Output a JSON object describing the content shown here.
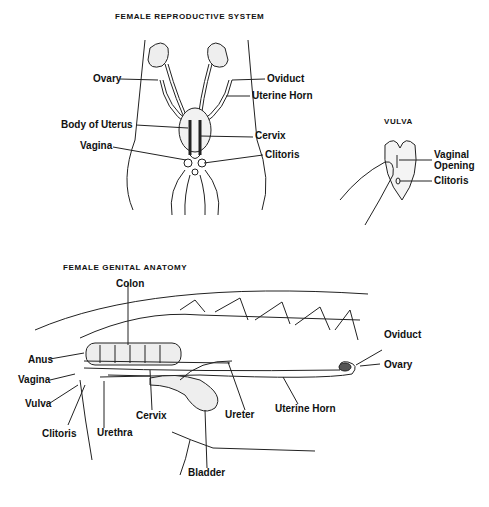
{
  "titles": {
    "reproductive_system": "FEMALE REPRODUCTIVE SYSTEM",
    "vulva": "VULVA",
    "genital_anatomy": "FEMALE GENITAL ANATOMY"
  },
  "reproductive_system_labels": {
    "ovary": "Ovary",
    "oviduct": "Oviduct",
    "uterine_horn": "Uterine Horn",
    "body_of_uterus": "Body of Uterus",
    "cervix": "Cervix",
    "vagina": "Vagina",
    "clitoris": "Clitoris"
  },
  "vulva_labels": {
    "vaginal_opening_1": "Vaginal",
    "vaginal_opening_2": "Opening",
    "clitoris": "Clitoris"
  },
  "genital_anatomy_labels": {
    "colon": "Colon",
    "oviduct": "Oviduct",
    "anus": "Anus",
    "ovary": "Ovary",
    "vagina": "Vagina",
    "vulva": "Vulva",
    "cervix": "Cervix",
    "ureter": "Ureter",
    "uterine_horn": "Uterine Horn",
    "clitoris": "Clitoris",
    "urethra": "Urethra",
    "bladder": "Bladder"
  }
}
